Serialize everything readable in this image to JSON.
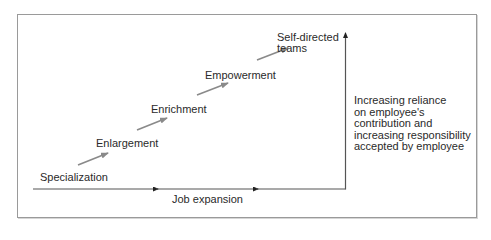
{
  "diagram": {
    "stages": [
      {
        "label": "Specialization"
      },
      {
        "label": "Enlargement"
      },
      {
        "label": "Enrichment"
      },
      {
        "label": "Empowerment"
      },
      {
        "label_line1": "Self-directed",
        "label_line2": "teams"
      }
    ],
    "x_axis_label": "Job expansion",
    "y_axis_description": {
      "lines": [
        "Increasing reliance",
        "on employee's",
        "contribution and",
        "increasing responsibility",
        "accepted by employee"
      ]
    },
    "colors": {
      "axis": "#555555",
      "stage_arrow": "#8a8a8a",
      "frame": "#9a9a9a",
      "text": "#2a2a2a"
    }
  }
}
